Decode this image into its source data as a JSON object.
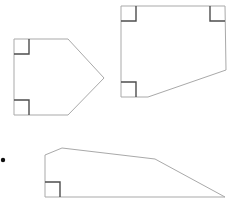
{
  "figure": {
    "canvas": {
      "width": 232,
      "height": 214
    },
    "colors": {
      "background": "#ffffff",
      "outline": "#a9a9a9",
      "right_angle_mark": "#4d4d4d",
      "bullet": "#111111"
    },
    "bullet": {
      "cx": 3,
      "cy": 160,
      "r": 2.2
    },
    "shapes": [
      {
        "id": "pentagon-left",
        "name": "left-pentagon",
        "points": "14,39 68,39 104,78 68,115 14,115",
        "right_angles": [
          {
            "id": "left-pentagon-corner-top-left",
            "path": "M 14,54 L 29,54 L 29,39"
          },
          {
            "id": "left-pentagon-corner-bottom-left",
            "path": "M 14,100 L 29,100 L 29,115"
          }
        ]
      },
      {
        "id": "pentagon-top-right",
        "name": "top-right-pentagon",
        "points": "121,6 225,6 226,70 148,97 121,97",
        "right_angles": [
          {
            "id": "top-right-pentagon-corner-top-left",
            "path": "M 121,21 L 136,21 L 136,6"
          },
          {
            "id": "top-right-pentagon-corner-top-right",
            "path": "M 225,21 L 210,21 L 210,6"
          },
          {
            "id": "top-right-pentagon-corner-bottom-left",
            "path": "M 121,82 L 136,82 L 136,97"
          }
        ]
      },
      {
        "id": "quadrilateral-bottom",
        "name": "bottom-quadrilateral",
        "points": "45,155 62,148 155,159 225,197 45,197",
        "right_angles": [
          {
            "id": "bottom-quadrilateral-corner-bottom-left",
            "path": "M 45,182 L 60,182 L 60,197"
          }
        ]
      }
    ]
  }
}
